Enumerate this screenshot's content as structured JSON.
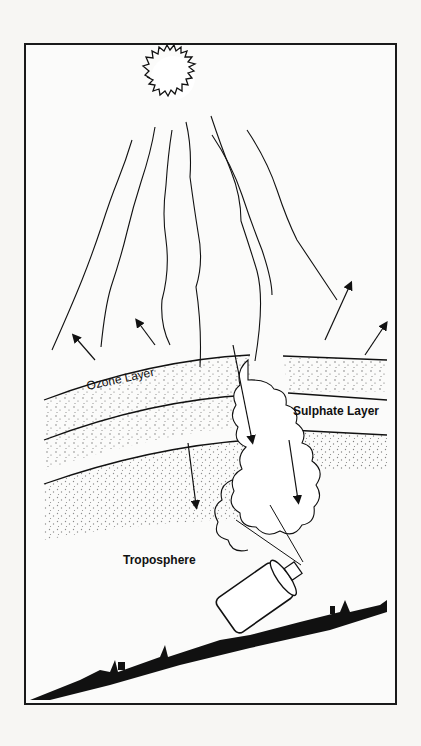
{
  "diagram": {
    "labels": {
      "ozone_layer": "Ozone Layer",
      "sulphate_layer": "Sulphate Layer",
      "troposphere": "Troposphere"
    },
    "elements": [
      "sun",
      "solar-rays",
      "reflected-arrows",
      "transmitted-arrows",
      "ozone-layer-band",
      "sulphate-layer-band",
      "aerosol-cloud",
      "aerosol-spray-can",
      "city-skyline-ground"
    ],
    "colors": {
      "ink": "#1a1a1a",
      "paper": "#f7f6f3"
    }
  }
}
